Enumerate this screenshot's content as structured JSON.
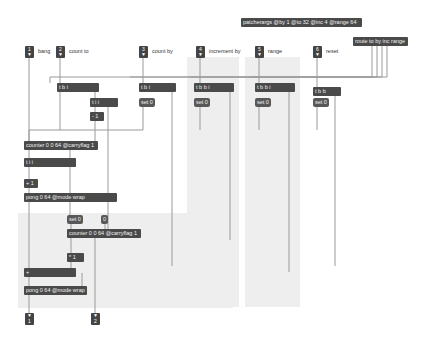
{
  "patcher": {
    "panels": [
      {
        "name": "increment-panel",
        "x": 187,
        "y": 57,
        "w": 52,
        "h": 250
      },
      {
        "name": "range-panel",
        "x": 245,
        "y": 57,
        "w": 55,
        "h": 250
      },
      {
        "name": "lower-panel",
        "x": 18,
        "y": 213,
        "w": 215,
        "h": 95
      }
    ],
    "inlets": [
      {
        "id": "inlet-1",
        "number": "1",
        "label": "bang",
        "x": 25,
        "y": 46
      },
      {
        "id": "inlet-2",
        "number": "2",
        "label": "count to",
        "x": 56,
        "y": 46
      },
      {
        "id": "inlet-3",
        "number": "3",
        "label": "count by",
        "x": 139,
        "y": 46
      },
      {
        "id": "inlet-4",
        "number": "4",
        "label": "increment by",
        "x": 196,
        "y": 46
      },
      {
        "id": "inlet-5",
        "number": "5",
        "label": "range",
        "x": 255,
        "y": 46
      },
      {
        "id": "inlet-6",
        "number": "6",
        "label": "reset",
        "x": 313,
        "y": 46
      }
    ],
    "outlets": [
      {
        "id": "outlet-1",
        "number": "1",
        "x": 25,
        "y": 313
      },
      {
        "id": "outlet-2",
        "number": "2",
        "x": 91,
        "y": 313
      }
    ],
    "objects": [
      {
        "id": "patcherargs",
        "text": "patcherargs @by 1 @to 32 @inc 4 @range 64",
        "x": 241,
        "y": 18,
        "w": 121
      },
      {
        "id": "route",
        "text": "route to by inc range",
        "x": 353,
        "y": 37,
        "w": 55
      },
      {
        "id": "t-b-i-1",
        "text": "t b i",
        "x": 57,
        "y": 83,
        "w": 42
      },
      {
        "id": "t-i-i",
        "text": "t i i",
        "x": 90,
        "y": 98,
        "w": 28
      },
      {
        "id": "minus-1",
        "text": "- 1",
        "x": 90,
        "y": 112,
        "w": 14
      },
      {
        "id": "t-b-i-2",
        "text": "t b i",
        "x": 139,
        "y": 83,
        "w": 37
      },
      {
        "id": "t-b-b-i-1",
        "text": "t b b i",
        "x": 194,
        "y": 83,
        "w": 40
      },
      {
        "id": "t-b-b-i-2",
        "text": "t b b i",
        "x": 255,
        "y": 83,
        "w": 40
      },
      {
        "id": "t-b-b",
        "text": "t b b",
        "x": 313,
        "y": 87,
        "w": 28
      },
      {
        "id": "counter-1",
        "text": "counter 0 0 64 @carryflag 1",
        "x": 24,
        "y": 141,
        "w": 74
      },
      {
        "id": "t-i-i-2",
        "text": "t i i",
        "x": 24,
        "y": 158,
        "w": 52
      },
      {
        "id": "plus-1",
        "text": "+ 1",
        "x": 24,
        "y": 179,
        "w": 14
      },
      {
        "id": "pong-1",
        "text": "pong 0 64 @mode wrap",
        "x": 24,
        "y": 193,
        "w": 93
      },
      {
        "id": "counter-2",
        "text": "counter 0 0 64 @carryflag 1",
        "x": 67,
        "y": 229,
        "w": 74
      },
      {
        "id": "times-1",
        "text": "* 1",
        "x": 67,
        "y": 253,
        "w": 17
      },
      {
        "id": "plus-2",
        "text": "+",
        "x": 24,
        "y": 268,
        "w": 52
      },
      {
        "id": "pong-2",
        "text": "pong 0 64 @mode wrap",
        "x": 24,
        "y": 286,
        "w": 63
      }
    ],
    "messages": [
      {
        "id": "set0-count-by",
        "text": "set 0",
        "x": 139,
        "y": 98
      },
      {
        "id": "set0-inc",
        "text": "set 0",
        "x": 194,
        "y": 98
      },
      {
        "id": "set0-range",
        "text": "set 0",
        "x": 255,
        "y": 98
      },
      {
        "id": "set0-reset",
        "text": "set 0",
        "x": 313,
        "y": 98
      },
      {
        "id": "set0-lower",
        "text": "set 0",
        "x": 67,
        "y": 215
      },
      {
        "id": "zero-msg",
        "text": "0",
        "x": 101,
        "y": 215
      }
    ]
  }
}
